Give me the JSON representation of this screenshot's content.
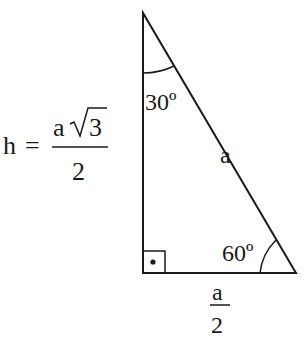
{
  "diagram": {
    "type": "30-60-90 right triangle",
    "formula": {
      "lhs": "h",
      "equals": "=",
      "numerator_var": "a",
      "numerator_root": "3",
      "denominator": "2"
    },
    "angles": {
      "top": "30º",
      "bottom_right": "60º",
      "right_angle_marker": "•"
    },
    "sides": {
      "hypotenuse": "a",
      "base_numerator": "a",
      "base_denominator": "2"
    }
  }
}
